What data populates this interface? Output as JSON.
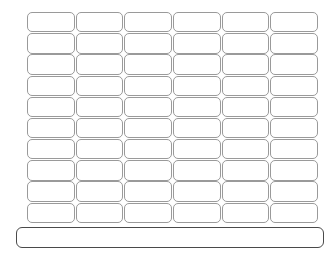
{
  "sheet": {
    "title": "",
    "background_color": "#ffffff"
  },
  "grid": {
    "columns": 6,
    "rows": 10,
    "cell_border_color": "#9a9a9a",
    "cell_fill_color": "#ffffff",
    "cells": [
      "",
      "",
      "",
      "",
      "",
      "",
      "",
      "",
      "",
      "",
      "",
      "",
      "",
      "",
      "",
      "",
      "",
      "",
      "",
      "",
      "",
      "",
      "",
      "",
      "",
      "",
      "",
      "",
      "",
      "",
      "",
      "",
      "",
      "",
      "",
      "",
      "",
      "",
      "",
      "",
      "",
      "",
      "",
      "",
      "",
      "",
      "",
      "",
      "",
      "",
      "",
      "",
      "",
      "",
      "",
      "",
      "",
      "",
      "",
      ""
    ]
  },
  "footer": {
    "label": "",
    "border_color": "#4a4a4a",
    "fill_color": "#ffffff"
  }
}
